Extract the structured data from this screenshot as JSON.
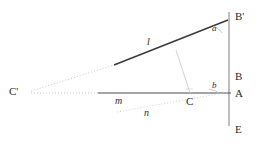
{
  "figure": {
    "type": "geometry-diagram",
    "width": 272,
    "height": 148,
    "background": "#ffffff",
    "stroke_dark": "#3a3a3a",
    "stroke_mid": "#6f6f6f",
    "stroke_light": "#b9b9b9",
    "stroke_faint": "#cfcfcf"
  },
  "points": {
    "b_prime": {
      "label": "B'",
      "x": 229,
      "y": 17
    },
    "b": {
      "label": "B",
      "x": 229,
      "y": 78
    },
    "a": {
      "label": "A",
      "x": 229,
      "y": 95
    },
    "e": {
      "label": "E",
      "x": 229,
      "y": 131
    },
    "c": {
      "label": "C",
      "x": 190,
      "y": 96
    },
    "c_prime": {
      "label": "C'",
      "x": 28,
      "y": 92
    }
  },
  "lines": {
    "l": {
      "label": "l",
      "x": 150,
      "y": 43,
      "style": "solid-dark",
      "role": "segment-C-prime-to-B-prime"
    },
    "m": {
      "label": "m",
      "x": 118,
      "y": 101,
      "style": "solid-dark",
      "role": "horizontal-line-through-C-and-A"
    },
    "n": {
      "label": "n",
      "x": 147,
      "y": 113,
      "style": "dotted-light",
      "role": "oblique-line-through-C"
    }
  },
  "angles": {
    "a": {
      "label": "a",
      "x": 215,
      "y": 29,
      "vertex": "B'"
    },
    "b": {
      "label": "b",
      "x": 214,
      "y": 86,
      "vertex": "A"
    }
  }
}
